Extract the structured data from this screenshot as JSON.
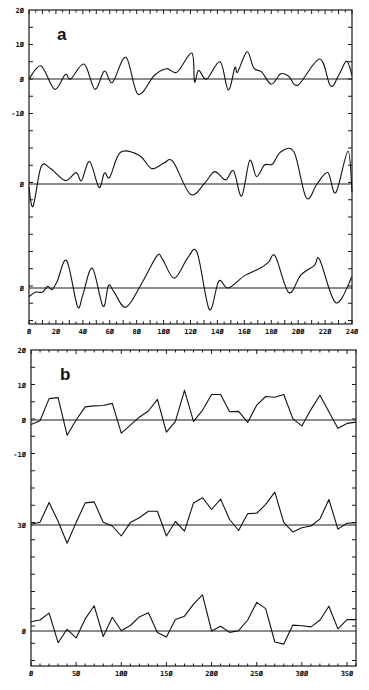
{
  "chart_data": [
    {
      "type": "line",
      "panel_label": "a",
      "title": "",
      "xlabel": "",
      "ylabel": "",
      "xlim": [
        0,
        240
      ],
      "x_ticks": [
        0,
        20,
        40,
        60,
        80,
        100,
        120,
        140,
        160,
        180,
        200,
        220,
        240
      ],
      "y_tick_labels": [
        "20",
        "10",
        "0",
        "-10",
        "0",
        "0"
      ],
      "grid": false,
      "smooth": true,
      "series": [
        {
          "name": "trace-1",
          "baseline_label": "0",
          "x": [
            0,
            9,
            19,
            27,
            31,
            41,
            49,
            56,
            62,
            72,
            81,
            93,
            102,
            110,
            121,
            123,
            126,
            132,
            142,
            148,
            153,
            155,
            162,
            167,
            173,
            180,
            187,
            193,
            200,
            216,
            224,
            230,
            236,
            240
          ],
          "values": [
            0,
            3.8,
            -3,
            1.3,
            0,
            4.3,
            -3,
            2.3,
            -1,
            6.3,
            -4.4,
            1,
            3,
            2,
            7.5,
            -0.8,
            2.5,
            0,
            5,
            -3.2,
            3.3,
            2,
            7.9,
            3.2,
            2,
            -1.5,
            1.5,
            0.8,
            -1.7,
            5.8,
            -2,
            1,
            5.2,
            1
          ]
        },
        {
          "name": "trace-2",
          "baseline_label": "0",
          "x": [
            0,
            3,
            9,
            16,
            27,
            35,
            39,
            45,
            52,
            56,
            60,
            68,
            82,
            91,
            100,
            107,
            120,
            131,
            138,
            146,
            152,
            158,
            164,
            169,
            175,
            181,
            187,
            197,
            206,
            214,
            222,
            228,
            237,
            240
          ],
          "values": [
            -1,
            -6.5,
            5,
            4.5,
            1,
            3.3,
            1,
            6.5,
            -1,
            3.2,
            2,
            9.2,
            8.3,
            4.5,
            6,
            6.5,
            -3,
            0.5,
            3.6,
            1.2,
            3.8,
            -3.5,
            6.8,
            2.2,
            5.5,
            5.8,
            9.3,
            9.2,
            -4,
            0,
            3.3,
            -2.5,
            9.5,
            -2.3
          ]
        },
        {
          "name": "trace-3",
          "baseline_label": "0",
          "x": [
            0,
            5,
            10,
            14,
            17,
            21,
            28,
            36,
            40,
            47,
            55,
            59,
            63,
            72,
            84,
            95,
            99,
            108,
            118,
            125,
            134,
            141,
            148,
            160,
            172,
            178,
            183,
            193,
            202,
            212,
            216,
            228,
            240
          ],
          "values": [
            -2.5,
            -1.2,
            -1.2,
            0.5,
            -0.5,
            2,
            7.9,
            -5.3,
            -2,
            5.7,
            -5.3,
            0.7,
            -1,
            -5.6,
            1.5,
            9.3,
            8.5,
            2.8,
            8.8,
            10.2,
            -6.2,
            2,
            0,
            3.5,
            5.8,
            7.5,
            9.2,
            -1.3,
            3.8,
            6.5,
            8.2,
            -4.3,
            3.3
          ]
        }
      ]
    },
    {
      "type": "line",
      "panel_label": "b",
      "title": "",
      "xlabel": "",
      "ylabel": "",
      "xlim": [
        0,
        360
      ],
      "x_ticks": [
        0,
        50,
        100,
        150,
        200,
        250,
        300,
        350
      ],
      "y_tick_labels": [
        "20",
        "10",
        "0",
        "-10",
        "30",
        "0"
      ],
      "grid": false,
      "smooth": false,
      "series": [
        {
          "name": "trace-1",
          "baseline_label": "0",
          "x": [
            0,
            10,
            20,
            30,
            40,
            50,
            60,
            70,
            80,
            90,
            100,
            110,
            120,
            130,
            140,
            150,
            160,
            170,
            180,
            190,
            200,
            210,
            220,
            230,
            240,
            250,
            260,
            270,
            280,
            290,
            300,
            310,
            320,
            330,
            340,
            350,
            360
          ],
          "values": [
            -1.3,
            -0.2,
            6.2,
            6.5,
            -4.4,
            0,
            3.8,
            4.1,
            4.2,
            4.8,
            -3.8,
            -1.5,
            0.8,
            2.6,
            6,
            -3.5,
            -0.4,
            8.6,
            -0.4,
            2.8,
            7.4,
            7.4,
            2.4,
            2.5,
            -0.7,
            4.3,
            6.8,
            6.6,
            7.4,
            0.4,
            -1.7,
            3,
            7.2,
            2.4,
            -2.4,
            -1,
            -0.6
          ]
        },
        {
          "name": "trace-2",
          "baseline_label": "30",
          "x": [
            0,
            10,
            20,
            30,
            40,
            50,
            60,
            70,
            80,
            90,
            100,
            110,
            120,
            130,
            140,
            150,
            160,
            170,
            180,
            190,
            200,
            210,
            220,
            230,
            240,
            250,
            260,
            270,
            280,
            290,
            300,
            310,
            320,
            330,
            340,
            350,
            360
          ],
          "values": [
            0.2,
            0.8,
            6.5,
            1.1,
            -5.3,
            0.7,
            6.4,
            6.7,
            0.8,
            -0.3,
            -3.2,
            0.7,
            2.1,
            4,
            4,
            -3.2,
            1,
            -1.8,
            6.4,
            7.9,
            4.5,
            7.5,
            1.6,
            -1.6,
            3.3,
            3.4,
            6,
            9.5,
            0.7,
            -2,
            -0.8,
            -0.3,
            1.7,
            7.4,
            -1.2,
            0.5,
            0.7
          ]
        },
        {
          "name": "trace-3",
          "baseline_label": "0",
          "x": [
            0,
            10,
            20,
            30,
            40,
            50,
            60,
            70,
            80,
            90,
            100,
            110,
            120,
            130,
            140,
            150,
            160,
            170,
            180,
            190,
            200,
            210,
            220,
            230,
            240,
            250,
            260,
            270,
            280,
            290,
            300,
            310,
            320,
            330,
            340,
            350,
            360
          ],
          "values": [
            2.7,
            3.2,
            5.2,
            -3.4,
            0.5,
            -2,
            3.5,
            7.3,
            -1.6,
            4,
            0.1,
            1.6,
            4.1,
            5.3,
            -0.4,
            -1.7,
            3.3,
            4.3,
            7.8,
            10.5,
            0,
            1.4,
            -0.4,
            0.1,
            3.2,
            8.3,
            6.5,
            -3.2,
            -3.8,
            1.7,
            1.5,
            1.2,
            3.1,
            7.2,
            0.6,
            3.3,
            3.3
          ]
        }
      ]
    }
  ],
  "panels": {
    "a": {
      "label": "a"
    },
    "b": {
      "label": "b"
    }
  }
}
